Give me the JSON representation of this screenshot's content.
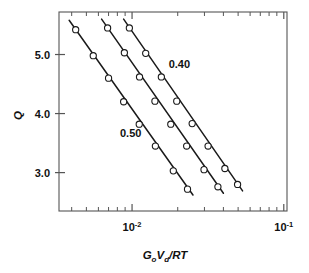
{
  "figure": {
    "background": "#ffffff",
    "frame_color": "#555555",
    "line_color": "#1a1a1a",
    "marker_face": "#ffffff",
    "marker_edge": "#1a1a1a"
  },
  "axes": {
    "x": {
      "label_parts": {
        "g": "G",
        "g_sub": "o",
        "v": "V",
        "v_sub": "d",
        "slash": "/",
        "rt": "RT"
      },
      "label_plain": "GoVd/RT",
      "scale": "log",
      "range": [
        0.0033,
        0.105
      ],
      "major_ticks": [
        {
          "value": 0.01,
          "mantissa": "10",
          "exponent": "-2"
        },
        {
          "value": 0.1,
          "mantissa": "10",
          "exponent": "-1"
        }
      ],
      "minor_ticks": [
        0.004,
        0.005,
        0.006,
        0.007,
        0.008,
        0.009,
        0.02,
        0.03,
        0.04,
        0.05,
        0.06,
        0.07,
        0.08,
        0.09
      ]
    },
    "y": {
      "label": "Q",
      "scale": "linear",
      "range": [
        2.35,
        5.72
      ],
      "major_ticks": [
        {
          "value": 3.0,
          "label": "3.0"
        },
        {
          "value": 4.0,
          "label": "4.0"
        },
        {
          "value": 5.0,
          "label": "5.0"
        }
      ]
    }
  },
  "annotations": [
    {
      "text": "0.40",
      "x": 0.0205,
      "y": 4.78
    },
    {
      "text": "0.50",
      "x": 0.0098,
      "y": 3.6
    }
  ],
  "chart_data": {
    "type": "line",
    "title": "",
    "xlabel": "GoVd/RT",
    "ylabel": "Q",
    "xscale": "log",
    "yscale": "linear",
    "xlim": [
      0.0033,
      0.105
    ],
    "ylim": [
      2.35,
      5.72
    ],
    "grid": false,
    "legend": "none",
    "marker": "open-circle",
    "annotations": [
      "0.40",
      "0.50"
    ],
    "series": [
      {
        "name": "0.50",
        "label": "0.50",
        "points": [
          {
            "x": 0.00425,
            "y": 5.42
          },
          {
            "x": 0.00555,
            "y": 4.98
          },
          {
            "x": 0.007,
            "y": 4.6
          },
          {
            "x": 0.0088,
            "y": 4.2
          },
          {
            "x": 0.01115,
            "y": 3.82
          },
          {
            "x": 0.01425,
            "y": 3.45
          },
          {
            "x": 0.0187,
            "y": 3.03
          },
          {
            "x": 0.0232,
            "y": 2.72
          }
        ],
        "fit_line": {
          "x_start": 0.00385,
          "y_start": 5.58,
          "x_end": 0.0252,
          "y_end": 2.62
        }
      },
      {
        "name": "0.45",
        "label": "",
        "points": [
          {
            "x": 0.0069,
            "y": 5.45
          },
          {
            "x": 0.0089,
            "y": 5.03
          },
          {
            "x": 0.0112,
            "y": 4.62
          },
          {
            "x": 0.01415,
            "y": 4.21
          },
          {
            "x": 0.018,
            "y": 3.82
          },
          {
            "x": 0.0229,
            "y": 3.45
          },
          {
            "x": 0.0298,
            "y": 3.05
          },
          {
            "x": 0.0368,
            "y": 2.76
          }
        ],
        "fit_line": {
          "x_start": 0.0063,
          "y_start": 5.6,
          "x_end": 0.04,
          "y_end": 2.65
        }
      },
      {
        "name": "0.40",
        "label": "0.40",
        "points": [
          {
            "x": 0.0096,
            "y": 5.45
          },
          {
            "x": 0.0123,
            "y": 5.02
          },
          {
            "x": 0.0156,
            "y": 4.62
          },
          {
            "x": 0.0197,
            "y": 4.21
          },
          {
            "x": 0.0249,
            "y": 3.83
          },
          {
            "x": 0.0317,
            "y": 3.45
          },
          {
            "x": 0.0409,
            "y": 3.07
          },
          {
            "x": 0.0496,
            "y": 2.8
          }
        ],
        "fit_line": {
          "x_start": 0.0088,
          "y_start": 5.6,
          "x_end": 0.0535,
          "y_end": 2.69
        }
      }
    ]
  }
}
